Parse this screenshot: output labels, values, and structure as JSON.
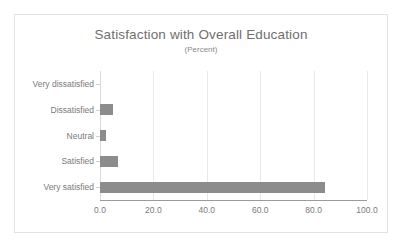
{
  "chart_data": {
    "type": "bar",
    "orientation": "horizontal",
    "title": "Satisfaction with Overall Education",
    "subtitle": "(Percent)",
    "xlabel": "",
    "ylabel": "",
    "categories": [
      "Very dissatisfied",
      "Dissatisfied",
      "Neutral",
      "Satisfied",
      "Very satisfied"
    ],
    "values": [
      0.0,
      4.8,
      2.2,
      6.7,
      84.4
    ],
    "xlim": [
      0.0,
      100.0
    ],
    "xticks": [
      "0.0",
      "20.0",
      "40.0",
      "60.0",
      "80.0",
      "100.0"
    ],
    "xtick_values": [
      0,
      20,
      40,
      60,
      80,
      100
    ],
    "grid": "vertical",
    "legend": "none",
    "series": [
      {
        "name": "Percent",
        "values": [
          0.0,
          4.8,
          2.2,
          6.7,
          84.4
        ]
      }
    ],
    "colors": {
      "bar": "#8c8c8c",
      "gridline": "#e8e8e8",
      "axis": "#9a9a9a",
      "text": "#7a7a7a",
      "title_text": "#6f6f6f",
      "frame_border": "#e2e2e2",
      "background": "#ffffff"
    }
  }
}
